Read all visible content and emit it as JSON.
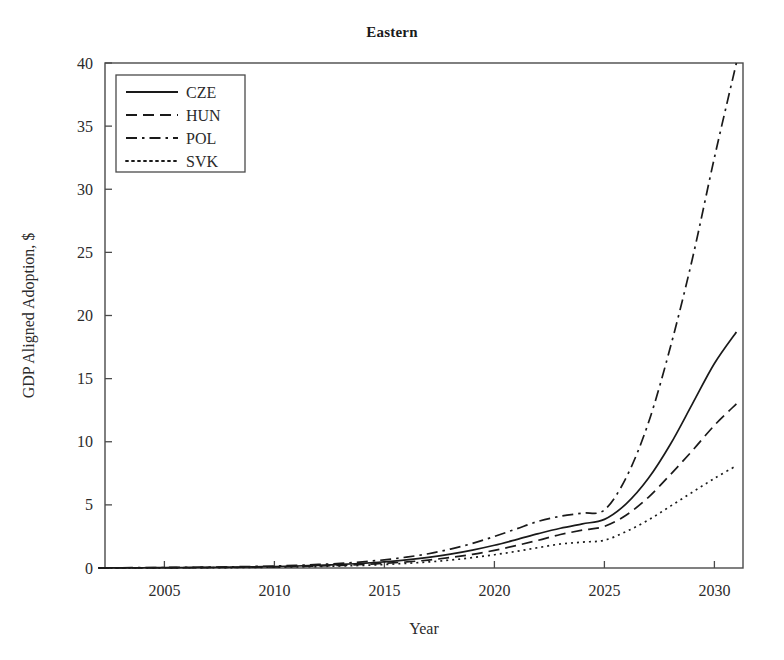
{
  "chart_data": {
    "type": "line",
    "title": "Eastern",
    "xlabel": "Year",
    "ylabel": "GDP Aligned Adoption, $",
    "xlim": [
      2002.3,
      2031.3
    ],
    "ylim": [
      0,
      40
    ],
    "xticks": [
      2005,
      2010,
      2015,
      2020,
      2025,
      2030
    ],
    "xticklabels": [
      "2005",
      "2010",
      "2015",
      "2020",
      "2025",
      "2030"
    ],
    "yticks": [
      0,
      5,
      10,
      15,
      20,
      25,
      30,
      35,
      40
    ],
    "yticklabels": [
      "0",
      "5",
      "10",
      "15",
      "20",
      "25",
      "30",
      "35",
      "40"
    ],
    "grid": false,
    "legend_position": "upper left",
    "x": [
      2002,
      2003,
      2004,
      2005,
      2006,
      2007,
      2008,
      2009,
      2010,
      2011,
      2012,
      2013,
      2014,
      2015,
      2016,
      2017,
      2018,
      2019,
      2020,
      2021,
      2022,
      2023,
      2024,
      2025,
      2026,
      2027,
      2028,
      2029,
      2030,
      2031
    ],
    "series": [
      {
        "name": "CZE",
        "linestyle": "solid",
        "color": "#1a1a1a",
        "values": [
          0.01,
          0.02,
          0.02,
          0.03,
          0.04,
          0.05,
          0.07,
          0.09,
          0.12,
          0.16,
          0.21,
          0.28,
          0.37,
          0.49,
          0.64,
          0.84,
          1.1,
          1.42,
          1.8,
          2.25,
          2.72,
          3.15,
          3.5,
          3.85,
          5.1,
          7.1,
          9.8,
          13.0,
          16.2,
          18.7
        ]
      },
      {
        "name": "HUN",
        "linestyle": "dashed",
        "color": "#1a1a1a",
        "values": [
          0.01,
          0.01,
          0.02,
          0.02,
          0.03,
          0.04,
          0.05,
          0.07,
          0.09,
          0.12,
          0.16,
          0.21,
          0.28,
          0.37,
          0.48,
          0.63,
          0.83,
          1.08,
          1.4,
          1.78,
          2.2,
          2.65,
          3.0,
          3.3,
          4.2,
          5.6,
          7.4,
          9.3,
          11.3,
          13.0
        ]
      },
      {
        "name": "POL",
        "linestyle": "dashdot",
        "color": "#1a1a1a",
        "values": [
          0.01,
          0.02,
          0.03,
          0.04,
          0.05,
          0.07,
          0.09,
          0.12,
          0.16,
          0.21,
          0.28,
          0.37,
          0.49,
          0.65,
          0.86,
          1.13,
          1.5,
          1.95,
          2.5,
          3.1,
          3.7,
          4.1,
          4.35,
          4.6,
          7.2,
          11.5,
          17.5,
          24.5,
          32.5,
          40.0
        ]
      },
      {
        "name": "SVK",
        "linestyle": "dotted",
        "color": "#1a1a1a",
        "values": [
          0.005,
          0.01,
          0.01,
          0.015,
          0.02,
          0.025,
          0.035,
          0.05,
          0.065,
          0.09,
          0.12,
          0.16,
          0.21,
          0.28,
          0.37,
          0.48,
          0.63,
          0.82,
          1.05,
          1.32,
          1.62,
          1.9,
          2.05,
          2.2,
          2.9,
          3.8,
          4.9,
          6.0,
          7.1,
          8.1
        ]
      }
    ]
  },
  "legend": {
    "entries": [
      {
        "label": "CZE",
        "style": "solid"
      },
      {
        "label": "HUN",
        "style": "dashed"
      },
      {
        "label": "POL",
        "style": "dashdot"
      },
      {
        "label": "SVK",
        "style": "dotted"
      }
    ]
  }
}
